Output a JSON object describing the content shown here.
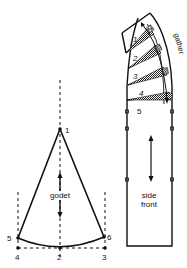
{
  "godet": {
    "label": "godet",
    "points": {
      "p1": "1",
      "p2": "2",
      "p3": "3",
      "p4": "4",
      "p5": "5",
      "p6": "6"
    }
  },
  "side_front": {
    "label_line1": "side",
    "label_line2": "front",
    "gather_label": "gather",
    "sections": [
      "1",
      "2",
      "3",
      "4",
      "5"
    ]
  },
  "colors": {
    "line": "#111111",
    "background": "#ffffff",
    "hatch": "#777777"
  }
}
